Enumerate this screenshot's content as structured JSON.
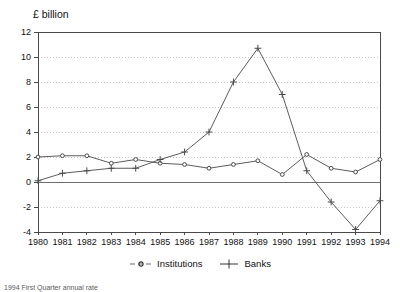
{
  "chart_data": {
    "type": "line",
    "title": "",
    "ylabel": "£ billion",
    "xlabel": "",
    "categories": [
      "1980",
      "1981",
      "1982",
      "1983",
      "1984",
      "1985",
      "1986",
      "1987",
      "1988",
      "1989",
      "1990",
      "1991",
      "1992",
      "1993",
      "1994"
    ],
    "ylim": [
      -4,
      12
    ],
    "yticks": [
      -4,
      -2,
      0,
      2,
      4,
      6,
      8,
      10,
      12
    ],
    "ytick_labels": [
      "-4",
      "-2",
      "0",
      "2",
      "4",
      "6",
      "8",
      "10",
      "12"
    ],
    "grid": true,
    "grid_style": "dotted-horizontal",
    "legend_position": "bottom-center",
    "series": [
      {
        "name": "Institutions",
        "marker": "circle",
        "color": "#4a4a4a",
        "values": [
          2.0,
          2.1,
          2.1,
          1.5,
          1.8,
          1.5,
          1.4,
          1.1,
          1.4,
          1.7,
          0.6,
          2.2,
          1.1,
          0.8,
          1.8
        ]
      },
      {
        "name": "Banks",
        "marker": "plus",
        "color": "#4a4a4a",
        "values": [
          0.1,
          0.7,
          0.9,
          1.1,
          1.1,
          1.8,
          2.4,
          4.0,
          8.0,
          10.7,
          7.0,
          0.9,
          -1.6,
          -3.8,
          -1.5
        ]
      }
    ]
  },
  "legend": {
    "items": [
      {
        "label": "Institutions",
        "marker": "circle"
      },
      {
        "label": "Banks",
        "marker": "plus"
      }
    ]
  },
  "footnote": {
    "text": "1994 First Quarter annual rate"
  }
}
